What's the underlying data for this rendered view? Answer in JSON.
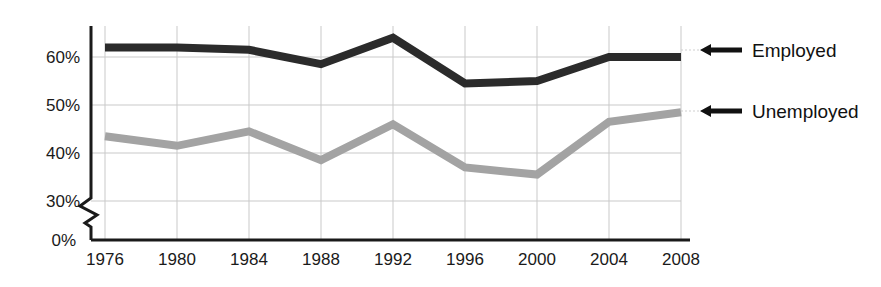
{
  "chart_data": {
    "type": "line",
    "title": "",
    "subtitle": "",
    "xlabel": "",
    "ylabel": "",
    "categories": [
      "1976",
      "1980",
      "1984",
      "1988",
      "1992",
      "1996",
      "2000",
      "2004",
      "2008"
    ],
    "x": [
      1976,
      1980,
      1984,
      1988,
      1992,
      1996,
      2000,
      2004,
      2008
    ],
    "series": [
      {
        "name": "Employed",
        "color": "#2b2b2b",
        "values": [
          62,
          62,
          61.5,
          58.5,
          64,
          54.5,
          55,
          60,
          60
        ]
      },
      {
        "name": "Unemployed",
        "color": "#a3a3a3",
        "values": [
          43.5,
          41.5,
          44.5,
          38.5,
          46,
          37,
          35.5,
          46.5,
          48.5
        ]
      }
    ],
    "ytick_labels": [
      "0%",
      "30%",
      "40%",
      "50%",
      "60%"
    ],
    "ytick_values": [
      0,
      30,
      40,
      50,
      60
    ],
    "ylim": [
      0,
      68
    ],
    "y_axis_break": true,
    "y_axis_break_between": [
      0,
      30
    ],
    "grid": true,
    "grid_axis": "both",
    "legend_position": "right-inline-arrow-labels",
    "annotations": [
      {
        "name": "employed-callout",
        "text": "Employed",
        "arrow": "left",
        "points_to_series": "Employed",
        "at_category": "2008"
      },
      {
        "name": "unemployed-callout",
        "text": "Unemployed",
        "arrow": "left",
        "points_to_series": "Unemployed",
        "at_category": "2008"
      }
    ]
  },
  "axis": {
    "ytick_0": "0%",
    "ytick_30": "30%",
    "ytick_40": "40%",
    "ytick_50": "50%",
    "ytick_60": "60%",
    "xtick_1976": "1976",
    "xtick_1980": "1980",
    "xtick_1984": "1984",
    "xtick_1988": "1988",
    "xtick_1992": "1992",
    "xtick_1996": "1996",
    "xtick_2000": "2000",
    "xtick_2004": "2004",
    "xtick_2008": "2008"
  },
  "callouts": {
    "employed_label": "Employed",
    "unemployed_label": "Unemployed"
  },
  "colors": {
    "employed_line": "#2b2b2b",
    "unemployed_line": "#a3a3a3",
    "grid": "#c9c9c9",
    "axis": "#1a1a1a",
    "text": "#1a1a1a",
    "background": "#ffffff"
  }
}
